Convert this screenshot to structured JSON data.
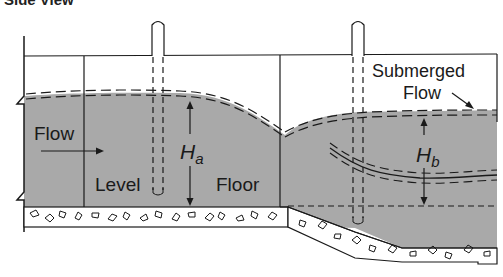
{
  "title": "Side View",
  "labels": {
    "flow": "Flow",
    "level": "Level",
    "floor": "Floor",
    "submerged_line1": "Submerged",
    "submerged_line2": "Flow",
    "ha_main": "H",
    "ha_sub": "a",
    "hb_main": "H",
    "hb_sub": "b"
  },
  "colors": {
    "water": "#a9a9a9",
    "line": "#1a1a1a",
    "concrete": "#ffffff",
    "background": "#ffffff"
  }
}
